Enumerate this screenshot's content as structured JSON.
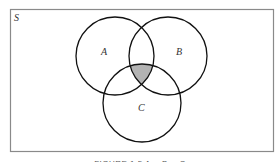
{
  "diagram": {
    "type": "venn",
    "universe_label": "S",
    "sets": [
      {
        "label": "A",
        "cx": 115,
        "cy": 56,
        "r": 39
      },
      {
        "label": "B",
        "cx": 168,
        "cy": 56,
        "r": 39
      },
      {
        "label": "C",
        "cx": 142,
        "cy": 103,
        "r": 39
      }
    ],
    "shaded_region": "A ∩ B ∩ C",
    "shade_color": "#b3b3b3",
    "stroke_color": "#111111"
  },
  "caption": "FIGURE 1.5  A ∩ B ∩ C"
}
